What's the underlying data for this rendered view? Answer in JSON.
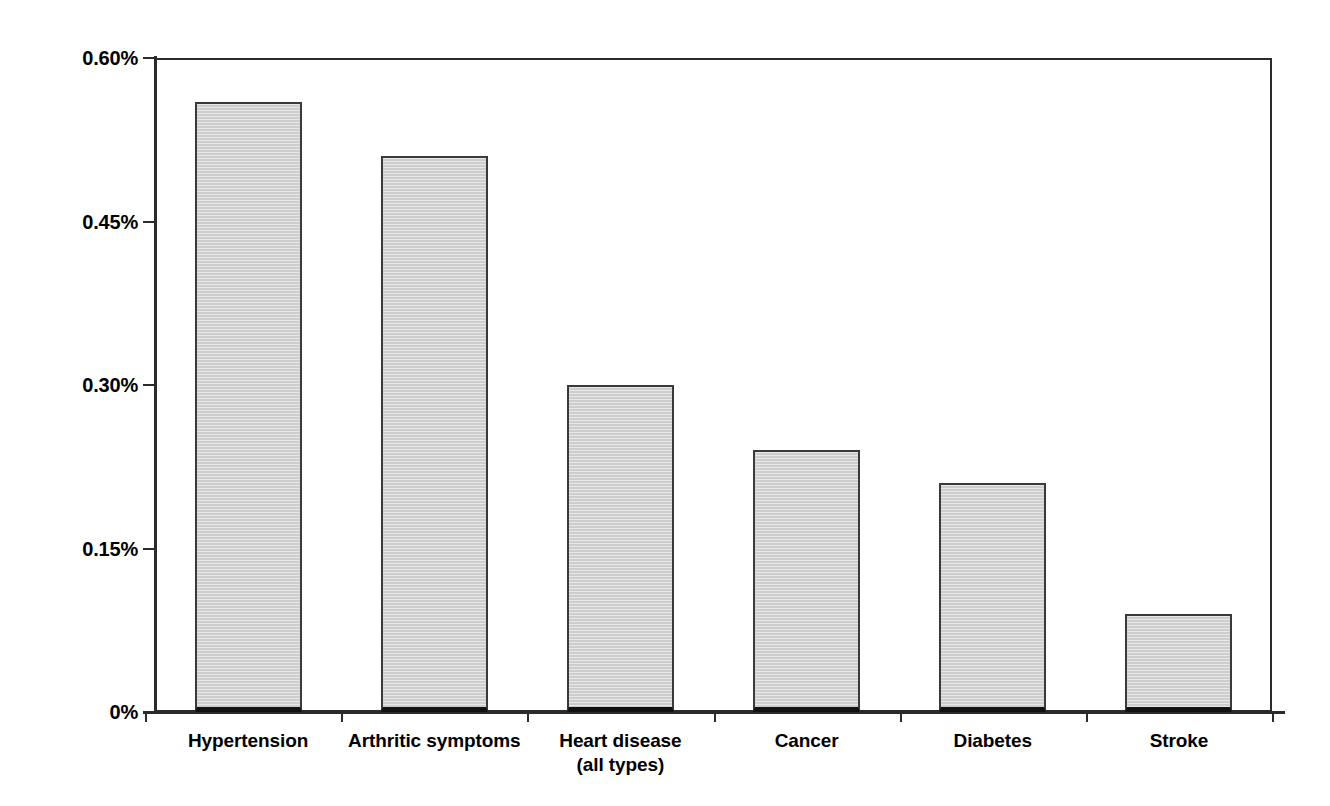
{
  "chart_data": {
    "type": "bar",
    "title": "",
    "subtitle": "",
    "xlabel": "",
    "ylabel": "",
    "categories": [
      "Hypertension",
      "Arthritic symptoms",
      "Heart disease\n(all types)",
      "Cancer",
      "Diabetes",
      "Stroke"
    ],
    "values": [
      0.56,
      0.51,
      0.3,
      0.24,
      0.21,
      0.09
    ],
    "value_unit": "%",
    "ylim": [
      0,
      0.6
    ],
    "ytick_values": [
      0,
      0.15,
      0.3,
      0.45,
      0.6
    ],
    "ytick_labels": [
      "0%",
      "0.15%",
      "0.30%",
      "0.45%",
      "0.60%"
    ],
    "grid": false,
    "legend": null,
    "bar_fill_color": "#cdcdcd",
    "bar_border_color": "#3a3a3a",
    "axis_color": "#2b2b2b",
    "background_color": "#ffffff"
  }
}
